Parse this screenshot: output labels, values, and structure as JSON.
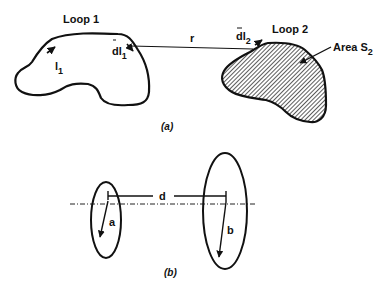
{
  "figure_a": {
    "caption": "(a)",
    "loop1": {
      "label": "Loop 1",
      "current_symbol": "l",
      "current_sub": "1",
      "element_symbol": "dl",
      "element_sub": "1"
    },
    "separation": {
      "label": "r"
    },
    "loop2": {
      "label": "Loop 2",
      "element_symbol": "dl",
      "element_sub": "2",
      "area_label": "Area S",
      "area_sub": "2"
    }
  },
  "figure_b": {
    "caption": "(b)",
    "distance_label": "d",
    "loop_small_radius_label": "a",
    "loop_large_radius_label": "b"
  },
  "colors": {
    "ink": "#111111",
    "background": "#ffffff"
  }
}
